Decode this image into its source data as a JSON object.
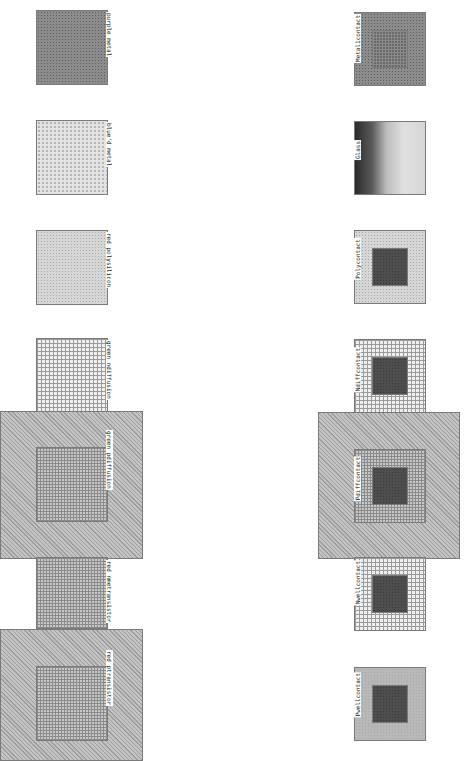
{
  "left_column": {
    "tiles": [
      {
        "label": "purple metal",
        "pattern": "dots-dark"
      },
      {
        "label": "blue'd metal",
        "pattern": "dots-light"
      },
      {
        "label": "red polysilicon",
        "pattern": "dots-med"
      },
      {
        "label": "green ndiffusion",
        "pattern": "grid-fine"
      },
      {
        "label": "green pdiffusion",
        "pattern": "hatch+grid"
      },
      {
        "label": "red nmetransistor",
        "pattern": "grid-med"
      },
      {
        "label": "red ptransistor",
        "pattern": "hatch+grid"
      }
    ]
  },
  "right_column": {
    "tiles": [
      {
        "label": "Metal1contact",
        "pattern": "dots-dark+grid"
      },
      {
        "label": "Glass",
        "pattern": "glass"
      },
      {
        "label": "Polycontact",
        "pattern": "dots-med+dark"
      },
      {
        "label": "Ndiffcontact",
        "pattern": "grid-fine+dark"
      },
      {
        "label": "Pdiffcontact",
        "pattern": "hatch+grid+dark"
      },
      {
        "label": "Nwellcontact",
        "pattern": "grid-fine+dark"
      },
      {
        "label": "Pwellcontact",
        "pattern": "dots-med+dark"
      }
    ]
  }
}
